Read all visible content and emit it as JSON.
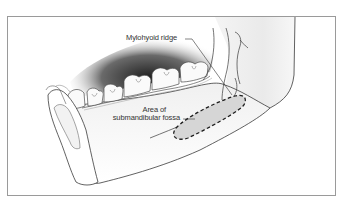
{
  "figure": {
    "type": "anatomical-illustration",
    "labels": {
      "mylohyoid_ridge": "Mylohyoid ridge",
      "area_line1": "Area of",
      "area_line2": "submandibular fossa"
    },
    "colors": {
      "frame_border": "#9a9a9a",
      "bone_outline": "#3a3a3a",
      "shadow": "#2b2b2b",
      "fossa_fill": "#d6d6d6",
      "fossa_dash": "#1e1e1e",
      "label_text": "#333333"
    }
  }
}
